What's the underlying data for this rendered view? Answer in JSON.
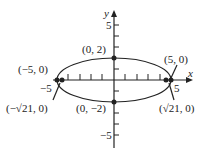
{
  "diagram": {
    "type": "ellipse-graph",
    "axes": {
      "x_label": "x",
      "y_label": "y",
      "x_ticks_labeled": [
        "-5",
        "5"
      ],
      "y_ticks_labeled": [
        "5",
        "-5"
      ]
    },
    "ellipse": {
      "a": 5,
      "b": 2
    },
    "points": {
      "top": "(0, 2)",
      "bottom": "(0, −2)",
      "left_vertex": "(−5, 0)",
      "right_vertex": "(5, 0)",
      "left_focus": "(−√21, 0)",
      "right_focus": "(√21, 0)"
    },
    "tick_labels": {
      "x_neg": "−5",
      "x_pos": "5",
      "y_pos": "5",
      "y_neg": "−5"
    }
  }
}
